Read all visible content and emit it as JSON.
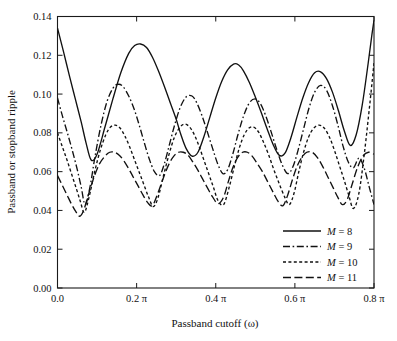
{
  "chart_data": {
    "type": "line",
    "title": "",
    "xlabel": "Passband cutoff (ω)",
    "ylabel": "Passband or stopband ripple",
    "xlim": [
      0.0,
      0.8
    ],
    "ylim": [
      0.0,
      0.14
    ],
    "grid": false,
    "legend_position": "lower-right",
    "x_unit": "π",
    "xticks": [
      0.0,
      0.2,
      0.4,
      0.6,
      0.8
    ],
    "xtick_labels": [
      "0.0",
      "0.2 π",
      "0.4 π",
      "0.6 π",
      "0.8 π"
    ],
    "yticks": [
      0.0,
      0.02,
      0.04,
      0.06,
      0.08,
      0.1,
      0.12,
      0.14
    ],
    "ytick_labels": [
      "0.00",
      "0.02",
      "0.04",
      "0.06",
      "0.08",
      "0.10",
      "0.12",
      "0.14"
    ],
    "series": [
      {
        "name": "M = 8",
        "dash": "solid",
        "x": [
          0.0,
          0.015,
          0.03,
          0.045,
          0.06,
          0.072,
          0.085,
          0.1,
          0.12,
          0.14,
          0.16,
          0.18,
          0.195,
          0.21,
          0.225,
          0.24,
          0.255,
          0.27,
          0.285,
          0.3,
          0.312,
          0.325,
          0.34,
          0.355,
          0.37,
          0.385,
          0.4,
          0.415,
          0.43,
          0.445,
          0.458,
          0.47,
          0.485,
          0.5,
          0.515,
          0.53,
          0.545,
          0.56,
          0.575,
          0.59,
          0.605,
          0.62,
          0.635,
          0.65,
          0.665,
          0.68,
          0.695,
          0.71,
          0.725,
          0.74,
          0.755,
          0.77,
          0.785,
          0.795,
          0.8
        ],
        "y": [
          0.134,
          0.122,
          0.1095,
          0.0975,
          0.0855,
          0.075,
          0.066,
          0.069,
          0.083,
          0.0975,
          0.111,
          0.121,
          0.125,
          0.1258,
          0.124,
          0.119,
          0.112,
          0.104,
          0.0955,
          0.087,
          0.079,
          0.072,
          0.068,
          0.07,
          0.078,
          0.088,
          0.098,
          0.1065,
          0.1125,
          0.1155,
          0.115,
          0.112,
          0.106,
          0.0985,
          0.0905,
          0.082,
          0.074,
          0.0685,
          0.0695,
          0.0775,
          0.088,
          0.098,
          0.106,
          0.111,
          0.1115,
          0.108,
          0.101,
          0.0915,
          0.081,
          0.0735,
          0.079,
          0.094,
          0.1155,
          0.131,
          0.138
        ]
      },
      {
        "name": "M = 9",
        "dash": "dashdot",
        "x": [
          0.0,
          0.012,
          0.025,
          0.038,
          0.05,
          0.06,
          0.07,
          0.082,
          0.095,
          0.11,
          0.125,
          0.14,
          0.152,
          0.165,
          0.18,
          0.195,
          0.208,
          0.22,
          0.232,
          0.245,
          0.258,
          0.27,
          0.283,
          0.296,
          0.31,
          0.325,
          0.34,
          0.352,
          0.365,
          0.378,
          0.392,
          0.405,
          0.418,
          0.43,
          0.443,
          0.456,
          0.47,
          0.485,
          0.5,
          0.513,
          0.526,
          0.54,
          0.554,
          0.568,
          0.582,
          0.595,
          0.608,
          0.622,
          0.636,
          0.65,
          0.665,
          0.68,
          0.695,
          0.71,
          0.722,
          0.735,
          0.748,
          0.762,
          0.775,
          0.788,
          0.8
        ],
        "y": [
          0.098,
          0.089,
          0.08,
          0.0705,
          0.061,
          0.052,
          0.043,
          0.052,
          0.068,
          0.084,
          0.096,
          0.103,
          0.105,
          0.104,
          0.099,
          0.0915,
          0.083,
          0.0745,
          0.0665,
          0.06,
          0.058,
          0.064,
          0.074,
          0.084,
          0.093,
          0.0985,
          0.099,
          0.0955,
          0.089,
          0.081,
          0.072,
          0.064,
          0.059,
          0.061,
          0.069,
          0.079,
          0.0885,
          0.0955,
          0.0975,
          0.095,
          0.089,
          0.0805,
          0.0715,
          0.0635,
          0.059,
          0.0625,
          0.071,
          0.082,
          0.093,
          0.101,
          0.1045,
          0.102,
          0.094,
          0.083,
          0.073,
          0.065,
          0.062,
          0.067,
          0.062,
          0.052,
          0.043
        ]
      },
      {
        "name": "M = 10",
        "dash": "dotted",
        "x": [
          0.0,
          0.012,
          0.024,
          0.036,
          0.048,
          0.058,
          0.068,
          0.08,
          0.094,
          0.108,
          0.122,
          0.134,
          0.146,
          0.158,
          0.17,
          0.182,
          0.194,
          0.206,
          0.218,
          0.23,
          0.242,
          0.254,
          0.268,
          0.282,
          0.296,
          0.31,
          0.322,
          0.334,
          0.346,
          0.358,
          0.37,
          0.382,
          0.394,
          0.406,
          0.42,
          0.434,
          0.448,
          0.46,
          0.472,
          0.484,
          0.496,
          0.508,
          0.52,
          0.533,
          0.546,
          0.56,
          0.574,
          0.586,
          0.598,
          0.61,
          0.622,
          0.634,
          0.646,
          0.66,
          0.674,
          0.688,
          0.7,
          0.712,
          0.724,
          0.736,
          0.748,
          0.762,
          0.776,
          0.79,
          0.8
        ],
        "y": [
          0.08,
          0.073,
          0.066,
          0.0585,
          0.051,
          0.0445,
          0.039,
          0.047,
          0.06,
          0.071,
          0.079,
          0.083,
          0.084,
          0.0825,
          0.0785,
          0.073,
          0.0665,
          0.06,
          0.0535,
          0.047,
          0.042,
          0.0465,
          0.058,
          0.069,
          0.078,
          0.083,
          0.0845,
          0.083,
          0.079,
          0.073,
          0.066,
          0.059,
          0.052,
          0.045,
          0.043,
          0.052,
          0.0635,
          0.0725,
          0.079,
          0.0825,
          0.083,
          0.0805,
          0.0755,
          0.069,
          0.0615,
          0.054,
          0.047,
          0.043,
          0.049,
          0.06,
          0.07,
          0.0775,
          0.082,
          0.084,
          0.0825,
          0.0775,
          0.071,
          0.0635,
          0.056,
          0.048,
          0.041,
          0.049,
          0.07,
          0.096,
          0.116
        ]
      },
      {
        "name": "M = 11",
        "dash": "dashed",
        "x": [
          0.0,
          0.012,
          0.024,
          0.036,
          0.046,
          0.056,
          0.066,
          0.078,
          0.092,
          0.106,
          0.12,
          0.132,
          0.144,
          0.156,
          0.168,
          0.18,
          0.192,
          0.204,
          0.216,
          0.228,
          0.24,
          0.254,
          0.268,
          0.282,
          0.294,
          0.306,
          0.318,
          0.33,
          0.342,
          0.354,
          0.366,
          0.378,
          0.392,
          0.406,
          0.42,
          0.432,
          0.444,
          0.456,
          0.468,
          0.48,
          0.492,
          0.504,
          0.518,
          0.532,
          0.546,
          0.558,
          0.57,
          0.582,
          0.594,
          0.606,
          0.618,
          0.63,
          0.644,
          0.658,
          0.672,
          0.684,
          0.696,
          0.708,
          0.72,
          0.732,
          0.744,
          0.758,
          0.772,
          0.786,
          0.8
        ],
        "y": [
          0.058,
          0.053,
          0.048,
          0.043,
          0.0395,
          0.037,
          0.04,
          0.048,
          0.057,
          0.064,
          0.068,
          0.07,
          0.07,
          0.0685,
          0.0655,
          0.0615,
          0.057,
          0.0525,
          0.048,
          0.044,
          0.0425,
          0.049,
          0.057,
          0.064,
          0.068,
          0.07,
          0.07,
          0.0685,
          0.065,
          0.061,
          0.0565,
          0.052,
          0.047,
          0.0435,
          0.047,
          0.055,
          0.0625,
          0.0675,
          0.07,
          0.07,
          0.068,
          0.0645,
          0.06,
          0.0545,
          0.049,
          0.0445,
          0.0425,
          0.048,
          0.056,
          0.063,
          0.0675,
          0.07,
          0.07,
          0.067,
          0.062,
          0.057,
          0.052,
          0.047,
          0.043,
          0.0455,
          0.053,
          0.062,
          0.068,
          0.07,
          0.069
        ]
      }
    ]
  },
  "legend": {
    "items": [
      {
        "label": "M = 8",
        "symbol": "M",
        "value": "= 8",
        "dash": "solid"
      },
      {
        "label": "M = 9",
        "symbol": "M",
        "value": "= 9",
        "dash": "dashdot"
      },
      {
        "label": "M = 10",
        "symbol": "M",
        "value": "= 10",
        "dash": "dotted"
      },
      {
        "label": "M = 11",
        "symbol": "M",
        "value": "= 11",
        "dash": "dashed"
      }
    ]
  },
  "axes": {
    "x_title": "Passband cutoff (ω)",
    "y_title": "Passband or stopband ripple"
  }
}
